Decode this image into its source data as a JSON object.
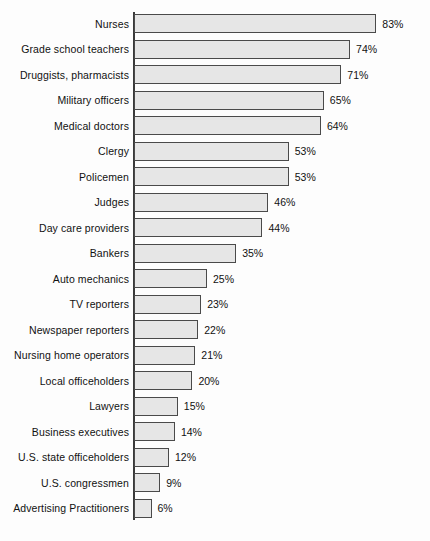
{
  "chart_data": {
    "type": "bar",
    "orientation": "horizontal",
    "title": "",
    "subtitle": "",
    "xlabel": "",
    "ylabel": "",
    "xlim": [
      0,
      100
    ],
    "grid": false,
    "legend": null,
    "value_suffix": "%",
    "categories": [
      "Nurses",
      "Grade school teachers",
      "Druggists, pharmacists",
      "Military officers",
      "Medical doctors",
      "Clergy",
      "Policemen",
      "Judges",
      "Day care providers",
      "Bankers",
      "Auto mechanics",
      "TV reporters",
      "Newspaper reporters",
      "Nursing home operators",
      "Local officeholders",
      "Lawyers",
      "Business executives",
      "U.S. state officeholders",
      "U.S. congressmen",
      "Advertising Practitioners"
    ],
    "values": [
      83,
      74,
      71,
      65,
      64,
      53,
      53,
      46,
      44,
      35,
      25,
      23,
      22,
      21,
      20,
      15,
      14,
      12,
      9,
      6
    ],
    "value_labels": [
      "83%",
      "74%",
      "71%",
      "65%",
      "64%",
      "53%",
      "53%",
      "46%",
      "44%",
      "35%",
      "25%",
      "23%",
      "22%",
      "21%",
      "20%",
      "15%",
      "14%",
      "12%",
      "9%",
      "6%"
    ],
    "colors": {
      "bar_fill": "#e6e6e6",
      "bar_border": "#4a4a4a",
      "axis": "#3a3a3a",
      "text": "#111111",
      "background": "#fdfdfd"
    }
  }
}
